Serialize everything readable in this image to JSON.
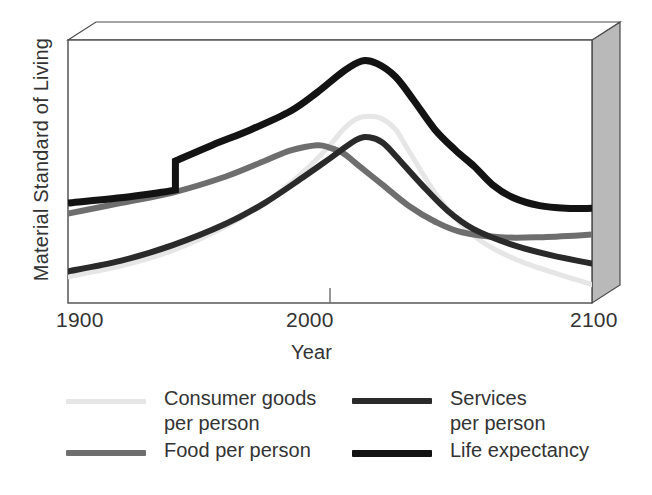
{
  "chart_data": {
    "type": "line",
    "title": "",
    "xlabel": "Year",
    "ylabel": "Material Standard of Living",
    "xlim": [
      1900,
      2100
    ],
    "ylim": [
      0,
      100
    ],
    "xticks": [
      1900,
      2000,
      2100
    ],
    "xticklabels": [
      "1900",
      "2000",
      "2100"
    ],
    "yticks": [],
    "yticklabels": [],
    "grid": false,
    "legend_position": "below-plot-two-columns",
    "style_note": "3D beveled box frame around plot area, no y-axis numeric scale",
    "series": [
      {
        "name": "Consumer goods per person",
        "color": "#e6e6e6",
        "width": 5,
        "legend_label": "Consumer goods\nper person",
        "x": [
          1900,
          1920,
          1940,
          1960,
          1975,
          1990,
          2000,
          2005,
          2010,
          2015,
          2020,
          2025,
          2030,
          2040,
          2050,
          2060,
          2075,
          2100
        ],
        "y": [
          10,
          14,
          20,
          29,
          38,
          50,
          60,
          66,
          70,
          71,
          70,
          66,
          58,
          42,
          30,
          22,
          15,
          7
        ]
      },
      {
        "name": "Food per person",
        "color": "#6e6e6e",
        "width": 6,
        "legend_label": "Food per person",
        "x": [
          1900,
          1920,
          1940,
          1960,
          1975,
          1985,
          1995,
          2000,
          2005,
          2010,
          2020,
          2030,
          2040,
          2050,
          2065,
          2080,
          2100
        ],
        "y": [
          34,
          38,
          42,
          48,
          54,
          58,
          60,
          59,
          57,
          53,
          45,
          37,
          31,
          27,
          25,
          25,
          26
        ]
      },
      {
        "name": "Services per person",
        "color": "#2a2a2a",
        "width": 6,
        "legend_label": "Services\nper person",
        "x": [
          1900,
          1920,
          1940,
          1960,
          1975,
          1990,
          2000,
          2010,
          2015,
          2020,
          2025,
          2035,
          2045,
          2055,
          2070,
          2085,
          2100
        ],
        "y": [
          12,
          16,
          22,
          30,
          38,
          48,
          55,
          62,
          63,
          61,
          56,
          45,
          35,
          28,
          22,
          18,
          15
        ]
      },
      {
        "name": "Life expectancy",
        "color": "#131313",
        "width": 7,
        "legend_label": "Life expectancy",
        "step_year": 1941,
        "x": [
          1900,
          1920,
          1935,
          1941,
          1941,
          1955,
          1970,
          1985,
          1995,
          2005,
          2012,
          2018,
          2025,
          2032,
          2040,
          2048,
          2055,
          2062,
          2070,
          2080,
          2090,
          2100
        ],
        "y": [
          38,
          40,
          42,
          43,
          54,
          60,
          66,
          73,
          80,
          88,
          92,
          91,
          86,
          77,
          66,
          58,
          52,
          45,
          40,
          37,
          36,
          36
        ]
      }
    ]
  },
  "axes": {
    "ylabel": "Material Standard of Living",
    "xlabel": "Year",
    "xtick_1900": "1900",
    "xtick_2000": "2000",
    "xtick_2100": "2100"
  },
  "legend": {
    "items": [
      {
        "id": "consumer-goods",
        "label": "Consumer goods\nper person",
        "color": "#e6e6e6",
        "thickness": 5
      },
      {
        "id": "food",
        "label": "Food per person",
        "color": "#6e6e6e",
        "thickness": 6
      },
      {
        "id": "services",
        "label": "Services\nper person",
        "color": "#2a2a2a",
        "thickness": 6
      },
      {
        "id": "life-expectancy",
        "label": "Life expectancy",
        "color": "#131313",
        "thickness": 7
      }
    ]
  },
  "colors": {
    "background": "#ffffff",
    "frame_line": "#4a4a4a",
    "box_right_face": "#b9b9b9",
    "box_top_face": "#ffffff",
    "text": "#333333"
  }
}
